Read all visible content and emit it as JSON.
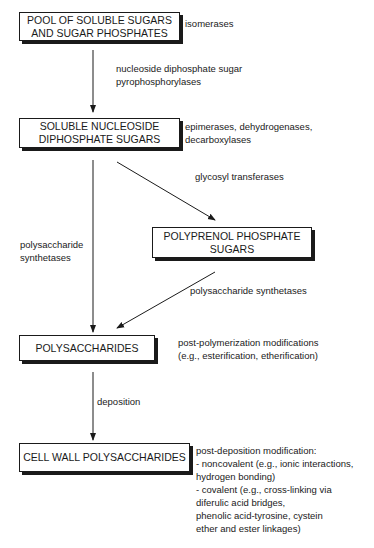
{
  "nodes": {
    "pool": {
      "line1": "POOL OF SOLUBLE SUGARS",
      "line2": "AND SUGAR PHOSPHATES"
    },
    "ndp": {
      "line1": "SOLUBLE NUCLEOSIDE",
      "line2": "DIPHOSPHATE SUGARS"
    },
    "polyprenol": {
      "line1": "POLYPRENOL PHOSPHATE",
      "line2": "SUGARS"
    },
    "polysaccharides": {
      "line1": "POLYSACCHARIDES"
    },
    "cellwall": {
      "line1": "CELL WALL POLYSACCHARIDES"
    }
  },
  "annotations": {
    "pool_side": [
      "isomerases"
    ],
    "pool_to_ndp": [
      "nucleoside diphosphate sugar",
      "pyrophosphorylases"
    ],
    "ndp_side": [
      "epimerases, dehydrogenases,",
      "decarboxylases"
    ],
    "ndp_to_polyprenol": [
      "glycosyl transferases"
    ],
    "ndp_to_polysaccharides": [
      "polysaccharide",
      "synthetases"
    ],
    "polyprenol_to_polysaccharides": [
      "polysaccharide synthetases"
    ],
    "polysaccharides_side": [
      "post-polymerization modifications",
      "(e.g., esterification, etherification)"
    ],
    "polysaccharides_to_cellwall": [
      "deposition"
    ],
    "cellwall_side": [
      "post-deposition modification:",
      "- noncovalent (e.g., ionic interactions,",
      "hydrogen bonding)",
      "- covalent (e.g., cross-linking via",
      "diferulic acid bridges,",
      "phenolic acid-tyrosine, cystein",
      "ether and ester linkages)"
    ]
  },
  "colors": {
    "line": "#1a1a1a",
    "background": "#ffffff"
  }
}
